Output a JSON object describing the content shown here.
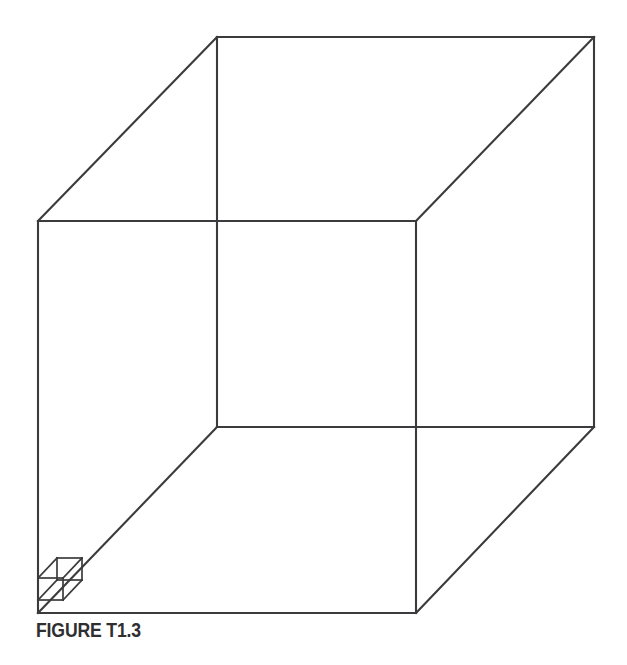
{
  "figure": {
    "caption": "FIGURE T1.3",
    "line_color": "#3b3b3d",
    "background_color": "#ffffff",
    "canvas": {
      "width": 627,
      "height": 665
    },
    "large_cube": {
      "name": "large-cube",
      "projection": "oblique",
      "front_face": {
        "top_left": [
          38,
          221
        ],
        "top_right": [
          416,
          221
        ],
        "bottom_right": [
          416,
          613
        ],
        "bottom_left": [
          38,
          613
        ]
      },
      "back_face": {
        "top_left": [
          217,
          37
        ],
        "top_right": [
          594,
          37
        ],
        "bottom_right": [
          594,
          427
        ],
        "bottom_left": [
          217,
          427
        ]
      },
      "depth_offset": [
        179,
        -186
      ],
      "edge_count": 12
    },
    "small_cube": {
      "name": "small-cube",
      "projection": "oblique",
      "front_face": {
        "top_left": [
          38,
          578
        ],
        "top_right": [
          63,
          578
        ],
        "bottom_right": [
          63,
          600
        ],
        "bottom_left": [
          38,
          600
        ]
      },
      "back_face": {
        "top_left": [
          57,
          558
        ],
        "top_right": [
          82,
          558
        ],
        "bottom_right": [
          82,
          580
        ],
        "bottom_left": [
          57,
          580
        ]
      },
      "depth_offset": [
        19,
        -20
      ],
      "edge_count": 12
    }
  }
}
